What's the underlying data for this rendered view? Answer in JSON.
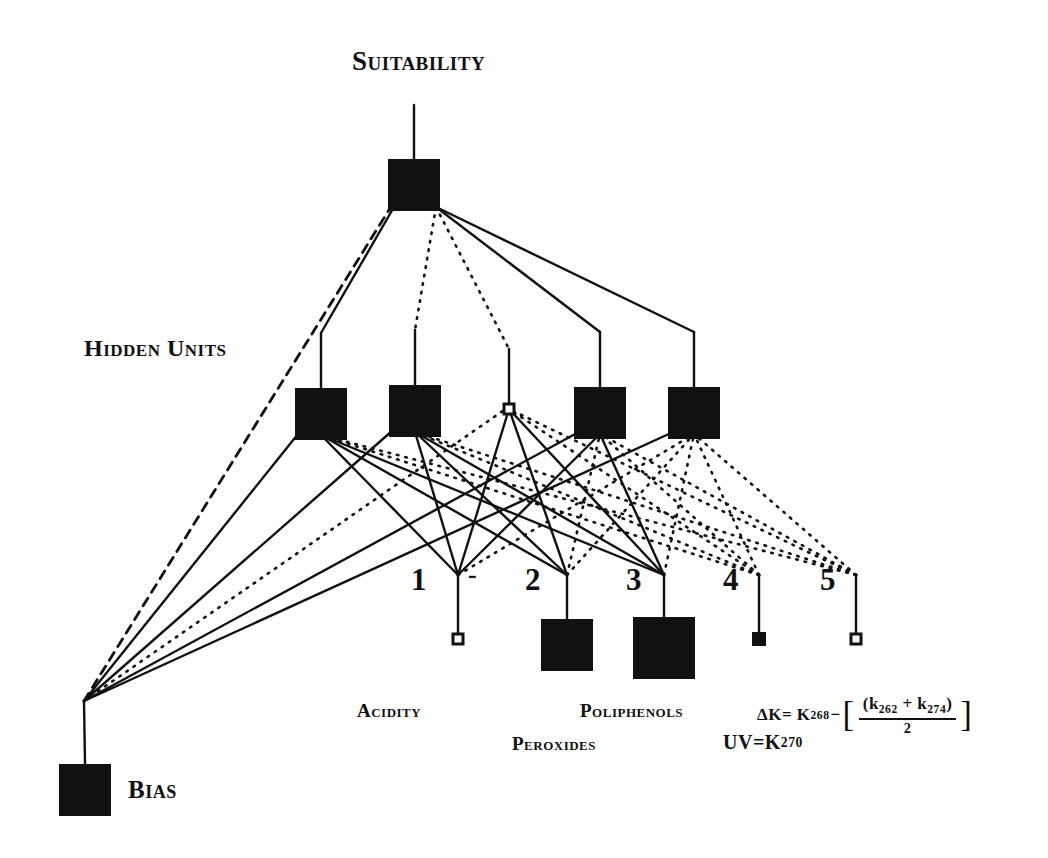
{
  "diagram": {
    "type": "neural-network-architecture",
    "title": "Suitability",
    "hidden_layer_label": "Hidden Units",
    "bias_label": "Bias",
    "ink_color": "#111111",
    "background_color": "#ffffff"
  },
  "output_layer": {
    "label": "Suitability",
    "node": {
      "id": "output",
      "x": 414,
      "y": 185,
      "size": "large"
    }
  },
  "hidden_layer": {
    "label": "Hidden Units",
    "nodes": [
      {
        "id": "h1",
        "index": 1,
        "x": 321,
        "y": 414,
        "size": "large"
      },
      {
        "id": "h2",
        "index": 2,
        "x": 415,
        "y": 411,
        "size": "large"
      },
      {
        "id": "h3",
        "index": 3,
        "x": 509,
        "y": 409,
        "size": "tiny"
      },
      {
        "id": "h4",
        "index": 4,
        "x": 600,
        "y": 413,
        "size": "large"
      },
      {
        "id": "h5",
        "index": 5,
        "x": 694,
        "y": 413,
        "size": "large"
      }
    ]
  },
  "input_layer": {
    "nodes": [
      {
        "id": "i1",
        "number": "1",
        "x": 458,
        "y": 639,
        "size": "tiny",
        "marker": "-"
      },
      {
        "id": "i2",
        "number": "2",
        "x": 567,
        "y": 645,
        "size": "large"
      },
      {
        "id": "i3",
        "number": "3",
        "x": 664,
        "y": 648,
        "size": "xlarge"
      },
      {
        "id": "i4",
        "number": "4",
        "x": 759,
        "y": 639,
        "size": "small"
      },
      {
        "id": "i5",
        "number": "5",
        "x": 856,
        "y": 639,
        "size": "tiny"
      }
    ],
    "numbers": [
      "1",
      "2",
      "3",
      "4",
      "5"
    ],
    "minus_sign": "-"
  },
  "bias": {
    "label": "Bias",
    "node": {
      "id": "bias",
      "x": 85,
      "y": 790,
      "size": "large"
    },
    "fan_origin": {
      "x": 84,
      "y": 701
    }
  },
  "feature_labels": {
    "acidity": "Acidity",
    "poliphenols": "Poliphenols",
    "peroxides": "Peroxides"
  },
  "formulas": {
    "uv": {
      "lhs": "UV=",
      "k": "K",
      "k_sub": "270"
    },
    "delta_k": {
      "delta": "Δ",
      "lhs_k": "K=",
      "first_k": "K",
      "first_sub": "268",
      "minus": "−",
      "bracket_open": "[",
      "bracket_close": "]",
      "num_open": "(",
      "num_k1": "k",
      "num_k1_sub": "262",
      "num_plus": "+",
      "num_k2": "k",
      "num_k2_sub": "274",
      "num_close": ")",
      "denominator": "2"
    }
  },
  "edges": {
    "legend": {
      "solid": "solid-weight",
      "dotted": "dotted-weight",
      "dashed": "dashed-weight"
    },
    "output_to_hidden": [
      {
        "from": "output",
        "to": "h1",
        "style": "solid"
      },
      {
        "from": "output",
        "to": "h2",
        "style": "dotted"
      },
      {
        "from": "output",
        "to": "h3",
        "style": "dotted"
      },
      {
        "from": "output",
        "to": "h4",
        "style": "solid"
      },
      {
        "from": "output",
        "to": "h5",
        "style": "solid"
      }
    ],
    "bias_edges": [
      {
        "from": "bias",
        "to": "output",
        "style": "dashed"
      },
      {
        "from": "bias",
        "to": "h1",
        "style": "solid"
      },
      {
        "from": "bias",
        "to": "h2",
        "style": "solid"
      },
      {
        "from": "bias",
        "to": "h3",
        "style": "dotted"
      },
      {
        "from": "bias",
        "to": "h4",
        "style": "solid"
      },
      {
        "from": "bias",
        "to": "h5",
        "style": "solid"
      }
    ],
    "input_to_hidden": [
      {
        "from": "i1",
        "to": "h1",
        "style": "solid"
      },
      {
        "from": "i1",
        "to": "h2",
        "style": "solid"
      },
      {
        "from": "i1",
        "to": "h3",
        "style": "solid"
      },
      {
        "from": "i1",
        "to": "h4",
        "style": "solid"
      },
      {
        "from": "i1",
        "to": "h5",
        "style": "dotted"
      },
      {
        "from": "i2",
        "to": "h1",
        "style": "solid"
      },
      {
        "from": "i2",
        "to": "h2",
        "style": "solid"
      },
      {
        "from": "i2",
        "to": "h3",
        "style": "solid"
      },
      {
        "from": "i2",
        "to": "h4",
        "style": "dotted"
      },
      {
        "from": "i2",
        "to": "h5",
        "style": "dotted"
      },
      {
        "from": "i3",
        "to": "h1",
        "style": "solid"
      },
      {
        "from": "i3",
        "to": "h2",
        "style": "solid"
      },
      {
        "from": "i3",
        "to": "h3",
        "style": "solid"
      },
      {
        "from": "i3",
        "to": "h4",
        "style": "solid"
      },
      {
        "from": "i3",
        "to": "h5",
        "style": "dotted"
      },
      {
        "from": "i4",
        "to": "h1",
        "style": "dotted"
      },
      {
        "from": "i4",
        "to": "h2",
        "style": "dotted"
      },
      {
        "from": "i4",
        "to": "h3",
        "style": "dotted"
      },
      {
        "from": "i4",
        "to": "h4",
        "style": "dotted"
      },
      {
        "from": "i4",
        "to": "h5",
        "style": "dotted"
      },
      {
        "from": "i5",
        "to": "h1",
        "style": "dotted"
      },
      {
        "from": "i5",
        "to": "h2",
        "style": "dotted"
      },
      {
        "from": "i5",
        "to": "h3",
        "style": "dotted"
      },
      {
        "from": "i5",
        "to": "h4",
        "style": "dotted"
      },
      {
        "from": "i5",
        "to": "h5",
        "style": "dotted"
      }
    ]
  }
}
